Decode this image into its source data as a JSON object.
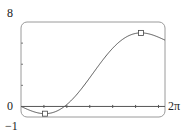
{
  "chart_data": {
    "type": "line",
    "title": "",
    "xlabel": "",
    "ylabel": "",
    "xlim": [
      0,
      6.283185
    ],
    "ylim": [
      -1,
      8
    ],
    "x_tick_labels": {
      "left": "0",
      "right": "2π"
    },
    "y_tick_labels": {
      "top": "8",
      "bottom": "-1"
    },
    "x_ticks": [
      1,
      2,
      3,
      4,
      5,
      6
    ],
    "y_ticks": [
      2,
      4,
      6
    ],
    "grid": false,
    "legend": null,
    "series": [
      {
        "name": "f(x) = x - 2 sin x",
        "color": "#555555",
        "x": [
          0,
          0.5,
          1.047,
          1.5,
          2.0,
          2.5,
          3.0,
          3.5,
          4.0,
          4.5,
          5.0,
          5.236,
          5.5,
          6.0,
          6.283
        ],
        "y": [
          0,
          -0.46,
          -0.685,
          -0.495,
          0.181,
          1.303,
          2.718,
          4.202,
          5.514,
          6.455,
          6.918,
          6.968,
          6.911,
          6.559,
          6.283
        ]
      }
    ],
    "annotations": [
      {
        "type": "marker",
        "shape": "square",
        "label": "local minimum",
        "x": 1.047,
        "y": -0.685
      },
      {
        "type": "marker",
        "shape": "square",
        "label": "local maximum",
        "x": 5.236,
        "y": 6.968
      }
    ]
  },
  "labels": {
    "y_max": "8",
    "y_min": "−1",
    "x_min": "0",
    "x_max": "2π"
  }
}
